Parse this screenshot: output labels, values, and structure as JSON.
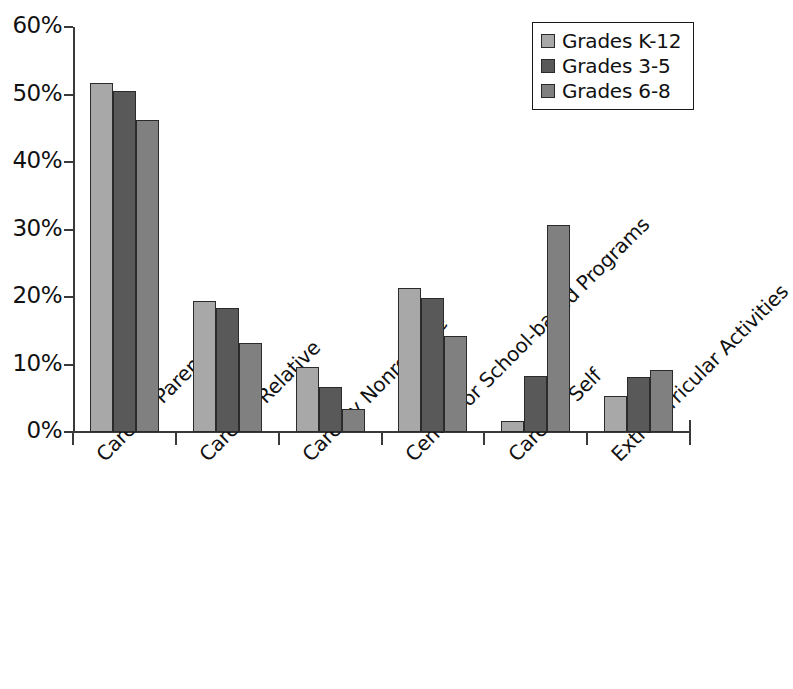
{
  "chart_data": {
    "type": "bar",
    "title": "",
    "subtitle": "",
    "xlabel": "",
    "ylabel": "",
    "ylim": [
      0,
      60
    ],
    "ytick_values": [
      0,
      10,
      20,
      30,
      40,
      50,
      60
    ],
    "ytick_labels": [
      "0%",
      "10%",
      "20%",
      "30%",
      "40%",
      "50%",
      "60%"
    ],
    "grid": false,
    "legend_position": "top-right",
    "value_unit": "percent",
    "categories": [
      "Care by Parents",
      "Care by Relative",
      "Care by Nonrelative",
      "Center- or School-based Programs",
      "Care for Self",
      "Extracurricular Activities"
    ],
    "series": [
      {
        "name": "Grades K-12",
        "color": "#a8a8a8",
        "values": [
          51.7,
          19.4,
          9.7,
          21.4,
          1.7,
          5.4
        ]
      },
      {
        "name": "Grades 3-5",
        "color": "#595959",
        "values": [
          50.5,
          18.4,
          6.6,
          19.9,
          8.3,
          8.2
        ]
      },
      {
        "name": "Grades 6-8",
        "color": "#808080",
        "values": [
          46.2,
          13.2,
          3.4,
          14.2,
          30.6,
          9.2
        ]
      }
    ]
  },
  "legend": {
    "entries": [
      {
        "label": "Grades K-12",
        "color": "#a8a8a8"
      },
      {
        "label": "Grades 3-5",
        "color": "#595959"
      },
      {
        "label": "Grades 6-8",
        "color": "#808080"
      }
    ]
  },
  "axes": {
    "y": {
      "labels": [
        "60%",
        "50%",
        "40%",
        "30%",
        "20%",
        "10%",
        "0%"
      ],
      "values": [
        60,
        50,
        40,
        30,
        20,
        10,
        0
      ]
    },
    "x": {
      "labels": [
        "Care by Parents",
        "Care by Relative",
        "Care by Nonrelative",
        "Center- or School-based Programs",
        "Care for Self",
        "Extracurricular Activities"
      ]
    }
  },
  "colors": {
    "axis": "#3a3a3a",
    "bar_outline": "#2b2b2b",
    "background": "#ffffff",
    "text": "#111111"
  }
}
